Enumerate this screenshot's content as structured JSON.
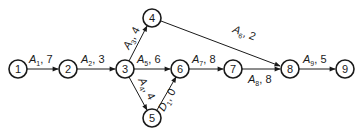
{
  "diagram": {
    "type": "activity-on-arrow network",
    "nodes": [
      {
        "id": "1",
        "label": "1",
        "x": 18,
        "y": 69
      },
      {
        "id": "2",
        "label": "2",
        "x": 68,
        "y": 69
      },
      {
        "id": "3",
        "label": "3",
        "x": 125,
        "y": 69
      },
      {
        "id": "4",
        "label": "4",
        "x": 152,
        "y": 18
      },
      {
        "id": "5",
        "label": "5",
        "x": 152,
        "y": 118
      },
      {
        "id": "6",
        "label": "6",
        "x": 180,
        "y": 69
      },
      {
        "id": "7",
        "label": "7",
        "x": 233,
        "y": 69
      },
      {
        "id": "8",
        "label": "8",
        "x": 290,
        "y": 69
      },
      {
        "id": "9",
        "label": "9",
        "x": 345,
        "y": 69
      }
    ],
    "edges": [
      {
        "from": "1",
        "to": "2",
        "name": "A",
        "sub": "1",
        "duration": "7"
      },
      {
        "from": "2",
        "to": "3",
        "name": "A",
        "sub": "2",
        "duration": "3"
      },
      {
        "from": "3",
        "to": "4",
        "name": "A",
        "sub": "3",
        "duration": "4"
      },
      {
        "from": "3",
        "to": "5",
        "name": "A",
        "sub": "4",
        "duration": "4"
      },
      {
        "from": "3",
        "to": "6",
        "name": "A",
        "sub": "5",
        "duration": "6"
      },
      {
        "from": "4",
        "to": "8",
        "name": "A",
        "sub": "6",
        "duration": "2"
      },
      {
        "from": "6",
        "to": "7",
        "name": "A",
        "sub": "7",
        "duration": "8"
      },
      {
        "from": "7",
        "to": "8",
        "name": "A",
        "sub": "8",
        "duration": "8"
      },
      {
        "from": "5",
        "to": "6",
        "name": "D",
        "sub": "1",
        "duration": "0"
      },
      {
        "from": "8",
        "to": "9",
        "name": "A",
        "sub": "9",
        "duration": "5"
      }
    ]
  }
}
